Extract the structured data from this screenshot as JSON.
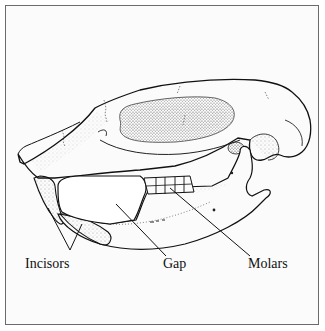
{
  "figure": {
    "colors": {
      "frame": "#6b6b6b",
      "background": "#fbfbfb",
      "ink": "#111111",
      "stipple": "#555555"
    }
  },
  "labels": [
    {
      "id": "incisors",
      "text": "Incisors",
      "x": 25,
      "y": 257
    },
    {
      "id": "gap",
      "text": "Gap",
      "x": 163,
      "y": 257
    },
    {
      "id": "molars",
      "text": "Molars",
      "x": 248,
      "y": 257
    }
  ]
}
